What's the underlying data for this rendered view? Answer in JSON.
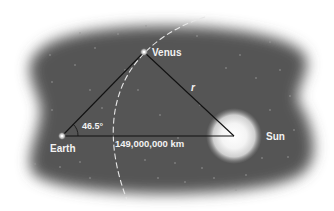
{
  "diagram": {
    "type": "astronomy-geometry",
    "labels": {
      "earth": "Earth",
      "venus": "Venus",
      "sun": "Sun",
      "radius": "r",
      "angle": "46.5°",
      "distance": "149,000,000 km"
    },
    "nodes": [
      {
        "id": "earth",
        "label": "Earth",
        "x": 62,
        "y": 136
      },
      {
        "id": "venus",
        "label": "Venus",
        "x": 144,
        "y": 52
      },
      {
        "id": "sun",
        "label": "Sun",
        "x": 234,
        "y": 136
      }
    ],
    "edges": [
      {
        "from": "earth",
        "to": "venus",
        "label": ""
      },
      {
        "from": "venus",
        "to": "sun",
        "label": "r"
      },
      {
        "from": "earth",
        "to": "sun",
        "label": "149,000,000 km"
      }
    ],
    "angle_at_earth": "46.5°",
    "colors": {
      "space": "#555555",
      "line": "#111111",
      "orbit": "#e6e6e6",
      "text": "#f2f2f2",
      "sun": "#ffffff"
    }
  }
}
